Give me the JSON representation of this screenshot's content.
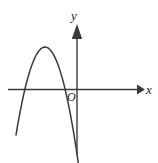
{
  "figure": {
    "background_color": "#ffffff",
    "stroke_color": "#3a3a3a",
    "label_color": "#1a1a1a"
  },
  "labels": {
    "x_axis": "x",
    "y_axis": "y",
    "origin": "O"
  },
  "chart_data": {
    "type": "line",
    "title": "",
    "xlabel": "x",
    "ylabel": "y",
    "grid": false,
    "legend": null,
    "axes": {
      "x_axis": {
        "label": "x",
        "orientation": "horizontal",
        "arrow": "right",
        "pixel_y": 89,
        "pixel_x_start": 8,
        "pixel_x_end": 143
      },
      "y_axis": {
        "label": "y",
        "orientation": "vertical",
        "arrow": "up",
        "pixel_x": 77,
        "pixel_y_start": 25,
        "pixel_y_end": 155
      },
      "origin": {
        "label": "O",
        "pixel_x": 77,
        "pixel_y": 89
      },
      "ticks": [],
      "tick_labels": []
    },
    "curves": [
      {
        "name": "parabola",
        "shape": "downward-opening parabola",
        "opens": "down",
        "vertex_pixel": [
          45,
          47
        ],
        "x_intercepts_pixel": [
          [
            23,
            89
          ],
          [
            79.5,
            89
          ]
        ],
        "y_intercept_pixel": [
          77,
          82
        ],
        "endpoints_pixel": [
          [
            16,
            135
          ],
          [
            85,
            137
          ]
        ],
        "description": "Vertex located in the second quadrant (left of the y-axis, above the x-axis). The curve crosses the x-axis at a negative value and again just to the right of the origin, giving a small positive y-intercept."
      }
    ]
  }
}
